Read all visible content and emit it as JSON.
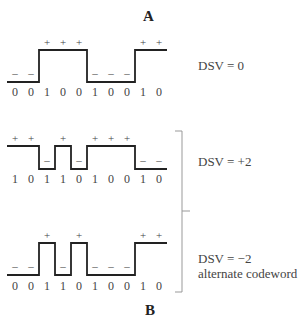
{
  "panels": {
    "A": {
      "label": "A",
      "rows": [
        {
          "bits": [
            "0",
            "0",
            "1",
            "0",
            "0",
            "1",
            "0",
            "0",
            "1",
            "0"
          ],
          "levels": [
            -1,
            -1,
            1,
            1,
            1,
            -1,
            -1,
            -1,
            1,
            1
          ],
          "signs": [
            "–",
            "–",
            "+",
            "+",
            "+",
            "–",
            "–",
            "–",
            "+",
            "+"
          ],
          "dsv_label": "DSV = 0"
        }
      ]
    },
    "B": {
      "label": "B",
      "rows": [
        {
          "bits": [
            "1",
            "0",
            "1",
            "1",
            "0",
            "1",
            "0",
            "0",
            "1",
            "0"
          ],
          "levels": [
            1,
            1,
            -1,
            1,
            -1,
            1,
            1,
            1,
            -1,
            -1
          ],
          "signs": [
            "+",
            "+",
            "–",
            "+",
            "–",
            "+",
            "+",
            "+",
            "–",
            "–"
          ],
          "dsv_label": "DSV = +2"
        },
        {
          "bits": [
            "0",
            "0",
            "1",
            "1",
            "0",
            "1",
            "0",
            "0",
            "1",
            "0"
          ],
          "levels": [
            -1,
            -1,
            1,
            -1,
            1,
            -1,
            -1,
            -1,
            1,
            1
          ],
          "signs": [
            "–",
            "–",
            "+",
            "–",
            "+",
            "–",
            "–",
            "–",
            "+",
            "+"
          ],
          "dsv_label": "DSV = −2",
          "note": "alternate codeword"
        }
      ]
    }
  },
  "style": {
    "line_color": "#222222",
    "bracket_color": "#999999"
  }
}
